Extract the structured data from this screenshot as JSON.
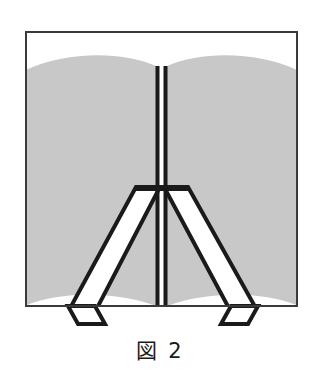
{
  "figure": {
    "caption": "図 2",
    "caption_label": "図",
    "caption_number": "2",
    "alt_description": "open-book-with-easel-stand",
    "canvas": {
      "width": 320,
      "height": 382
    },
    "colors": {
      "background": "#ffffff",
      "page_gray": "#c8c8c8",
      "ink": "#1a1a1a",
      "frame": "#3a3a3a",
      "caption_text": "#1a1a1a"
    },
    "frame": {
      "name": "figure-border",
      "x": 25,
      "y": 31,
      "width": 273,
      "height": 276,
      "stroke_width": 2
    },
    "book": {
      "name": "open-book",
      "left_page": {
        "label": "left-page",
        "x_left": 26,
        "x_right": 156,
        "top_peak_y": 57,
        "top_edge_y": 71,
        "bottom_edge_y": 306,
        "bottom_arc_y": 284
      },
      "right_page": {
        "label": "right-page",
        "x_left": 167,
        "x_right": 297,
        "top_peak_y": 57,
        "top_edge_y": 71,
        "bottom_edge_y": 306,
        "bottom_arc_y": 284
      },
      "spine": {
        "label": "book-spine",
        "left_line_x": 157.5,
        "right_line_x": 165.5,
        "top_y": 66,
        "bottom_y": 306,
        "stroke_width": 4
      }
    },
    "stand": {
      "name": "easel-stand",
      "top_bar_y": 189,
      "top_bar_x_left": 136,
      "top_bar_x_right": 188,
      "stroke_width": 4,
      "left_leg": {
        "label": "left-leg",
        "outer_top_x": 136,
        "outer_bottom_x": 68,
        "inner_top_x": 160,
        "inner_bottom_x": 95,
        "top_y": 189,
        "bottom_y": 311
      },
      "right_leg": {
        "label": "right-leg",
        "outer_top_x": 188,
        "outer_bottom_x": 258,
        "inner_top_x": 164,
        "inner_bottom_x": 231,
        "top_y": 189,
        "bottom_y": 311
      },
      "left_foot": {
        "label": "left-foot",
        "points": "68,311 95,311 105,323 78,323"
      },
      "right_foot": {
        "label": "right-foot",
        "points": "231,311 258,311 248,323 221,323"
      }
    }
  }
}
